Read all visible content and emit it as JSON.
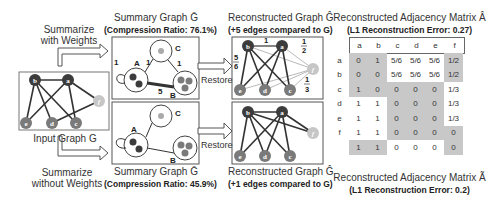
{
  "input": {
    "label": "Input Graph G",
    "summarize_with_weights": [
      "Summarize",
      "with Weights"
    ],
    "summarize_without_weights": [
      "Summarize",
      "without Weights"
    ],
    "nodes": [
      "a",
      "b",
      "c",
      "d",
      "e",
      "f"
    ],
    "edges": [
      [
        "b",
        "a"
      ],
      [
        "b",
        "e"
      ],
      [
        "b",
        "d"
      ],
      [
        "b",
        "c"
      ],
      [
        "a",
        "e"
      ],
      [
        "a",
        "c"
      ],
      [
        "a",
        "f"
      ],
      [
        "d",
        "f"
      ]
    ]
  },
  "top": {
    "summary_title": "Summary Graph Ḡ",
    "summary_subtitle": "(Compression Ratio: 76.1%)",
    "supernodes": [
      "A",
      "B",
      "C"
    ],
    "edge_weights": {
      "A_self": "1",
      "A_C": "1",
      "C_B": "1",
      "A_B": "5"
    },
    "restore_label": "Restore",
    "recon_title": "Reconstructed Graph Ĝ",
    "recon_subtitle": "(+5 edges compared to G)",
    "recon_weights": {
      "ab": "1",
      "b_group": "5/6",
      "f_a": "1/2",
      "f_c": "1/3"
    },
    "matrix_title": "Reconstructed Adjacency Matrix Â",
    "matrix_subtitle": "(L1 Reconstruction Error: 0.27)",
    "matrix_headers": [
      "a",
      "b",
      "c",
      "d",
      "e",
      "f"
    ],
    "matrix_rows": [
      [
        "0",
        "1",
        "5/6",
        "5/6",
        "5/6",
        "1/2"
      ],
      [
        "",
        "0",
        "5/6",
        "5/6",
        "5/6",
        "1/2"
      ],
      [
        "",
        "",
        "0",
        "0",
        "0",
        "1/3"
      ],
      [
        "",
        "",
        "",
        "0",
        "0",
        "1/3"
      ],
      [
        "",
        "",
        "",
        "",
        "0",
        "1/3"
      ],
      [
        "",
        "",
        "",
        "",
        "",
        "0"
      ]
    ]
  },
  "bottom": {
    "summary_title": "Summary Graph Ḡ",
    "summary_subtitle": "(Compression Ratio: 45.9%)",
    "supernodes": [
      "A",
      "B",
      "C"
    ],
    "restore_label": "Restore",
    "recon_title": "Reconstructed Graph Ĝ",
    "recon_subtitle": "(+1 edges compared to G)",
    "matrix_title": "Reconstructed Adjacency Matrix Ã",
    "matrix_subtitle": "(L1 Reconstruction Error: 0.2)",
    "row_labels": [
      "a",
      "b",
      "c",
      "d",
      "e",
      "f"
    ],
    "matrix_rows": [
      [
        "0",
        "",
        "",
        "",
        "",
        ""
      ],
      [
        "1",
        "0",
        "",
        "",
        "",
        ""
      ],
      [
        "1",
        "1",
        "0",
        "",
        "",
        ""
      ],
      [
        "1",
        "1",
        "0",
        "0",
        "",
        ""
      ],
      [
        "1",
        "1",
        "0",
        "0",
        "0",
        ""
      ],
      [
        "1",
        "1",
        "0",
        "0",
        "0",
        "0"
      ]
    ]
  },
  "colors": {
    "dark_node": "#3c3c3c",
    "mid_node": "#7a7a7a",
    "light_node": "#c6c6c6",
    "shade": "#c8c8c8"
  }
}
